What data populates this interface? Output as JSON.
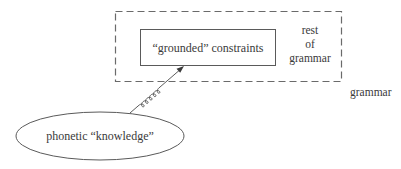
{
  "diagram": {
    "outer_box": {
      "label": "grammar"
    },
    "rest_label": {
      "lines": [
        "rest",
        "of",
        "grammar"
      ]
    },
    "inner_box": {
      "label": "“grounded” constraints"
    },
    "ellipse": {
      "label": "phonetic “knowledge”"
    },
    "connector": {
      "type": "coiled-arrow",
      "from": "ellipse",
      "to": "inner_box"
    },
    "colors": {
      "stroke": "#5a5a5a",
      "text": "#3a3a3a",
      "dashed": "#6a6a6a"
    }
  }
}
